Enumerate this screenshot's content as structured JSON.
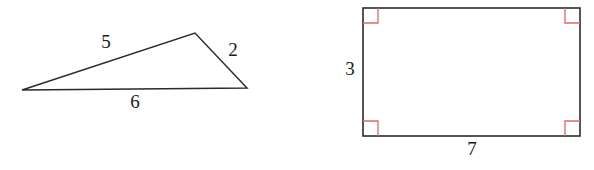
{
  "figure": {
    "background_color": "#ffffff",
    "stroke_color": "#2b2b2b",
    "right_angle_color": "#e06a5e",
    "label_color": "#1a1a1a"
  },
  "triangle": {
    "name": "scalene-triangle",
    "vertices": {
      "left": {
        "x": 22,
        "y": 90
      },
      "apex": {
        "x": 195,
        "y": 33
      },
      "right": {
        "x": 247,
        "y": 88
      }
    },
    "side_labels": [
      {
        "id": "triangle-side-5",
        "value": "5",
        "x": 106,
        "y": 44
      },
      {
        "id": "triangle-side-2",
        "value": "2",
        "x": 233,
        "y": 52
      },
      {
        "id": "triangle-side-6",
        "value": "6",
        "x": 135,
        "y": 104
      }
    ]
  },
  "rectangle": {
    "name": "rectangle",
    "bounds": {
      "x": 363,
      "y": 8,
      "width": 217,
      "height": 128
    },
    "right_angle_marker_size": 15,
    "right_angle_corners": [
      "top-left",
      "top-right",
      "bottom-left",
      "bottom-right"
    ],
    "side_labels": [
      {
        "id": "rectangle-side-3",
        "value": "3",
        "x": 350,
        "y": 71
      },
      {
        "id": "rectangle-side-7",
        "value": "7",
        "x": 472,
        "y": 151
      }
    ]
  }
}
